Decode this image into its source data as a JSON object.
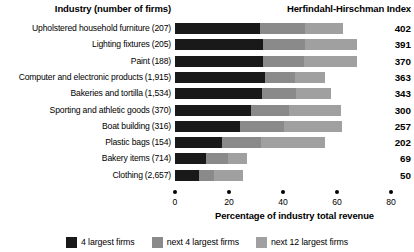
{
  "header": {
    "industry_title": "Industry (number of firms)",
    "hhi_title": "Herfindahl-Hirschman Index"
  },
  "chart_data": {
    "type": "bar",
    "orientation": "horizontal",
    "stacked": true,
    "title": "Herfindahl-Hirschman Index",
    "xlabel": "Percentage of industry total revenue",
    "ylabel": "Industry (number of firms)",
    "xlim": [
      0,
      80
    ],
    "xticks": [
      0,
      20,
      40,
      60,
      80
    ],
    "xtick_labels": [
      "0",
      "20",
      "40",
      "60",
      "80"
    ],
    "grid": false,
    "legend_position": "bottom",
    "categories": [
      "Upholstered household furniture",
      "Lighting fixtures",
      "Paint",
      "Computer and electronic products",
      "Bakeries and tortilla",
      "Sporting and athletic goods",
      "Boat building",
      "Plastic bags",
      "Bakery items",
      "Clothing"
    ],
    "firm_counts": [
      "(207)",
      "(205)",
      "(188)",
      "(1,915)",
      "(1,534)",
      "(370)",
      "(316)",
      "(154)",
      "(714)",
      "(2,657)"
    ],
    "series": [
      {
        "name": "4 largest firms",
        "color": "#191919",
        "values": [
          31.5,
          32.6,
          32.6,
          33.3,
          32.2,
          28.1,
          24.1,
          17.4,
          11.5,
          8.9
        ]
      },
      {
        "name": "next 4 largest firms",
        "color": "#8a8a8a",
        "values": [
          16.7,
          15.6,
          15.2,
          11.1,
          12.6,
          14.1,
          16.3,
          14.4,
          8.1,
          5.6
        ]
      },
      {
        "name": "next 12 largest firms",
        "color": "#a0a0a0",
        "values": [
          14.1,
          19.3,
          19.6,
          11.1,
          13.0,
          19.3,
          21.5,
          23.7,
          7.1,
          10.7
        ]
      }
    ],
    "hhi_values": [
      402,
      391,
      370,
      363,
      343,
      300,
      257,
      202,
      69,
      50
    ]
  },
  "legend": [
    {
      "label": "4 largest firms",
      "color": "#191919"
    },
    {
      "label": "next 4 largest firms",
      "color": "#8a8a8a"
    },
    {
      "label": "next 12 largest firms",
      "color": "#a0a0a0"
    }
  ]
}
